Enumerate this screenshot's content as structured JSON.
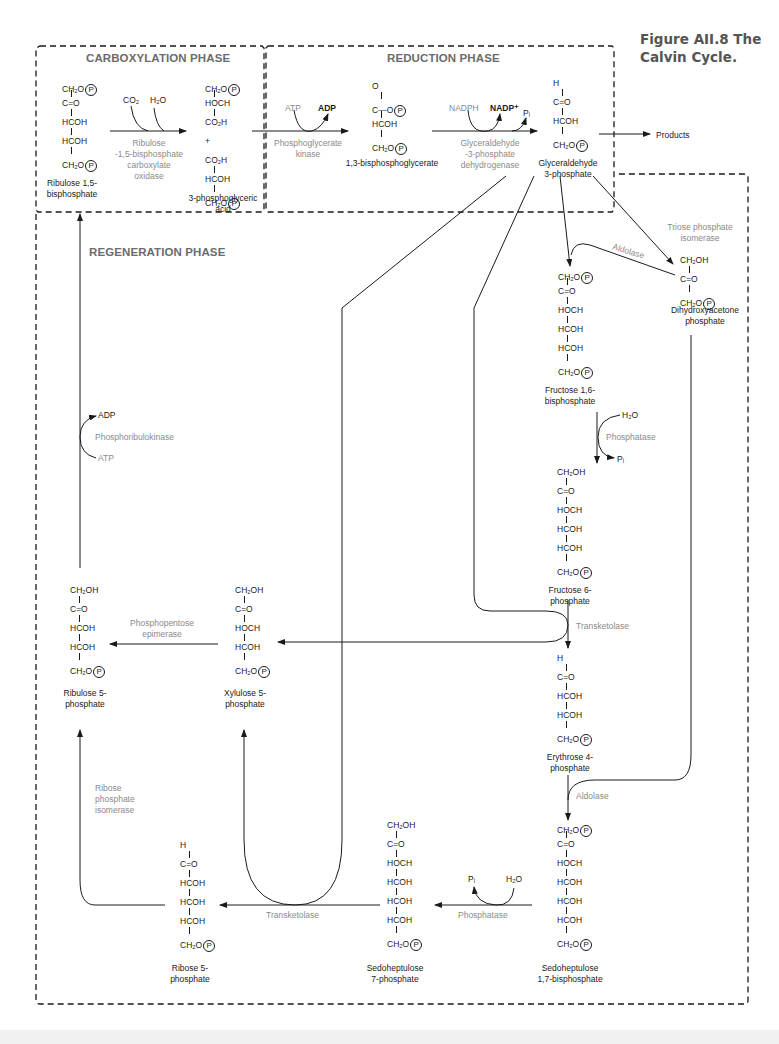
{
  "figure": {
    "title_label": "Figure AII.8",
    "title_text": "The",
    "title_text2": "Calvin Cycle."
  },
  "phases": {
    "carboxylation": "CARBOXYLATION PHASE",
    "reduction": "REDUCTION PHASE",
    "regeneration": "REGENERATION PHASE"
  },
  "enzymes": {
    "rubisco": [
      "Ribulose",
      "-1,5-bisphosphate",
      "carboxylate",
      "oxidase"
    ],
    "pgk": [
      "Phosphoglycerate",
      "kinase"
    ],
    "gapdh": [
      "Glyceraldehyde",
      "-3-phosphate",
      "dehydrogenase"
    ],
    "tpi": [
      "Triose phosphate",
      "isomerase"
    ],
    "aldolase_1": "Aldolase",
    "phosphatase_1": "Phosphatase",
    "transketolase_1": "Transketolase",
    "aldolase_2": "Aldolase",
    "phosphatase_2": "Phosphatase",
    "transketolase_2": "Transketolase",
    "epimerase": [
      "Phosphopentose",
      "epimerase"
    ],
    "rpi": [
      "Ribose",
      "phosphate",
      "isomerase"
    ],
    "prk": "Phosphoribulokinase"
  },
  "cofactors": {
    "co2": "CO₂",
    "h2o_1": "H₂O",
    "atp_1": "ATP",
    "adp_1": "ADP",
    "nadph": "NADPH",
    "nadp": "NADP⁺",
    "pi_1": "Pᵢ",
    "h2o_2": "H₂O",
    "pi_2": "Pᵢ",
    "h2o_3": "H₂O",
    "pi_3": "Pᵢ",
    "adp_2": "ADP",
    "atp_2": "ATP",
    "products": "Products"
  },
  "molecules": {
    "rubp": {
      "name": [
        "Ribulose 1,5-",
        "bisphosphate"
      ],
      "rows": [
        "CH₂O|P",
        "C=O",
        "HCOH",
        "HCOH",
        "CH₂O|P"
      ]
    },
    "pga": {
      "name": [
        "3-phosphoglyceric",
        "acid"
      ],
      "rows": [
        "CH₂O|P",
        "HOCH",
        "CO₂H",
        "+",
        "CO₂H",
        "HCOH",
        "CH₂O|P"
      ]
    },
    "bpg": {
      "name": [
        "1,3-bisphosphoglycerate"
      ],
      "rows": [
        "O",
        "C—O|P",
        "HCOH",
        "CH₂O|P"
      ]
    },
    "g3p": {
      "name": [
        "Glyceraldehyde",
        "3-phosphate"
      ],
      "rows": [
        "H",
        "C=O",
        "HCOH",
        "CH₂O|P"
      ]
    },
    "dhap": {
      "name": [
        "Dihydroxyacetone",
        "phosphate"
      ],
      "rows": [
        "CH₂OH",
        "C=O",
        "CH₂O|P"
      ]
    },
    "fbp": {
      "name": [
        "Fructose 1,6-",
        "bisphosphate"
      ],
      "rows": [
        "CH₂O|P",
        "C=O",
        "HOCH",
        "HCOH",
        "HCOH",
        "CH₂O|P"
      ]
    },
    "f6p": {
      "name": [
        "Fructose 6-",
        "phosphate"
      ],
      "rows": [
        "CH₂OH",
        "C=O",
        "HOCH",
        "HCOH",
        "HCOH",
        "CH₂O|P"
      ]
    },
    "e4p": {
      "name": [
        "Erythrose 4-",
        "phosphate"
      ],
      "rows": [
        "H",
        "C=O",
        "HCOH",
        "HCOH",
        "CH₂O|P"
      ]
    },
    "sbp": {
      "name": [
        "Sedoheptulose",
        "1,7-bisphosphate"
      ],
      "rows": [
        "CH₂O|P",
        "C=O",
        "HOCH",
        "HCOH",
        "HCOH",
        "HCOH",
        "CH₂O|P"
      ]
    },
    "s7p": {
      "name": [
        "Sedoheptulose",
        "7-phosphate"
      ],
      "rows": [
        "CH₂OH",
        "C=O",
        "HOCH",
        "HCOH",
        "HCOH",
        "HCOH",
        "CH₂O|P"
      ]
    },
    "r5p": {
      "name": [
        "Ribose 5-",
        "phosphate"
      ],
      "rows": [
        "H",
        "C=O",
        "HCOH",
        "HCOH",
        "HCOH",
        "CH₂O|P"
      ]
    },
    "xu5p": {
      "name": [
        "Xylulose 5-",
        "phosphate"
      ],
      "rows": [
        "CH₂OH",
        "C=O",
        "HOCH",
        "HCOH",
        "CH₂O|P"
      ]
    },
    "ru5p": {
      "name": [
        "Ribulose 5-",
        "phosphate"
      ],
      "rows": [
        "CH₂OH",
        "C=O",
        "HCOH",
        "HCOH",
        "CH₂O|P"
      ]
    }
  },
  "colors": {
    "line": "#1a1a1a",
    "enzyme_text": "#8a8a8a",
    "phase_text": "#6b6b6b",
    "figure_title": "#555555"
  }
}
